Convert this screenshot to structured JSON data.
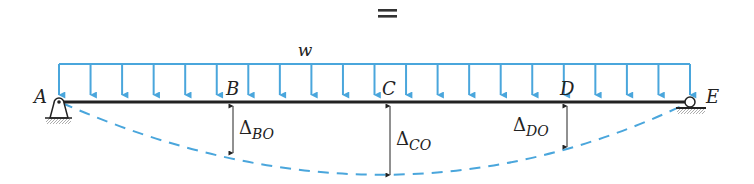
{
  "header": {
    "symbol": "="
  },
  "load": {
    "label": "w",
    "type": "uniformly-distributed",
    "color": "#4aa6dc",
    "arrow_count": 21,
    "x_start": 59,
    "x_end": 690
  },
  "beam": {
    "color": "#222222",
    "points": [
      {
        "id": "A",
        "label": "A",
        "x": 59
      },
      {
        "id": "B",
        "label": "B",
        "x": 233
      },
      {
        "id": "C",
        "label": "C",
        "x": 390
      },
      {
        "id": "D",
        "label": "D",
        "x": 567
      },
      {
        "id": "E",
        "label": "E",
        "x": 690
      }
    ]
  },
  "supports": {
    "A": "pin-support",
    "E": "roller-support"
  },
  "deflections": [
    {
      "id": "B",
      "symbol": "Δ",
      "subscript": "BO",
      "x": 233,
      "y_bottom": 153
    },
    {
      "id": "C",
      "symbol": "Δ",
      "subscript": "CO",
      "x": 390,
      "y_bottom": 175
    },
    {
      "id": "D",
      "symbol": "Δ",
      "subscript": "DO",
      "x": 567,
      "y_bottom": 147
    }
  ],
  "deflected_shape": {
    "style": "dashed",
    "color": "#4aa6dc"
  }
}
